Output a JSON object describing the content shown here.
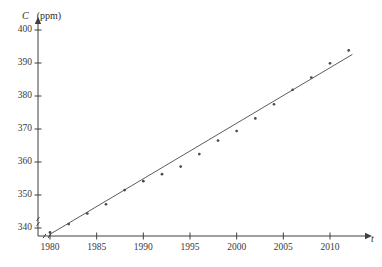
{
  "figure": {
    "background": "#ffffff",
    "ink_color": "#3f3f3f",
    "point_color": "#4a4a4a",
    "line_color": "#4a4a4a",
    "y_axis_symbol": "C",
    "y_axis_unit": "(ppm)",
    "x_axis_symbol": "t",
    "axis_break_marker": "double-slash"
  },
  "chart_data": {
    "type": "scatter",
    "title": "",
    "xlabel": "t",
    "ylabel": "C (ppm)",
    "xlim": [
      1979,
      2013
    ],
    "ylim": [
      336,
      401
    ],
    "grid": false,
    "legend": "none",
    "axis_break": true,
    "xticks": [
      1980,
      1985,
      1990,
      1995,
      2000,
      2005,
      2010
    ],
    "xtick_labels": [
      "1980",
      "1985",
      "1990",
      "1995",
      "2000",
      "2005",
      "2010"
    ],
    "yticks": [
      340,
      350,
      360,
      370,
      380,
      390,
      400
    ],
    "ytick_labels": [
      "340",
      "350",
      "360",
      "370",
      "380",
      "390",
      "400"
    ],
    "series": [
      {
        "name": "CO2 concentration",
        "marker": "dot",
        "x": [
          1980,
          1982,
          1984,
          1986,
          1988,
          1990,
          1992,
          1994,
          1996,
          1998,
          2000,
          2002,
          2004,
          2006,
          2008,
          2010,
          2012
        ],
        "y": [
          338.7,
          341.2,
          344.4,
          347.2,
          351.5,
          354.2,
          356.3,
          358.6,
          362.4,
          366.5,
          369.4,
          373.2,
          377.5,
          381.9,
          385.6,
          389.9,
          393.8
        ]
      }
    ],
    "trendline": {
      "name": "least-squares regression line",
      "x_start": 1980,
      "y_start": 338.1,
      "x_end": 2012.4,
      "y_end": 392.6
    }
  },
  "axis_labels": {
    "y_ticks": [
      "400",
      "390",
      "380",
      "370",
      "360",
      "350",
      "340"
    ],
    "x_ticks": [
      "1980",
      "1985",
      "1990",
      "1995",
      "2000",
      "2005",
      "2010"
    ]
  }
}
